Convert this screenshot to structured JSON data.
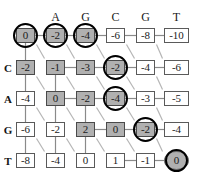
{
  "figure": {
    "type": "dp-matrix"
  },
  "colors": {
    "shaded_cell": "#b0b0b0",
    "plain_cell": "#ffffff",
    "cell_border": "#5a5a5a",
    "highlight_ring": "#000000",
    "edge_diagonal": "#b5b5b5",
    "edge_straight": "#8a8a8a",
    "text": "#1a1a1a"
  },
  "matrix": {
    "column_headers": [
      "",
      "A",
      "G",
      "C",
      "G",
      "T"
    ],
    "row_headers": [
      "",
      "C",
      "A",
      "G",
      "T"
    ],
    "rows": [
      {
        "label": "",
        "cells": [
          {
            "value": "0",
            "shaded": true,
            "circled": true,
            "shape": "box"
          },
          {
            "value": "-2",
            "shaded": true,
            "circled": true,
            "shape": "box"
          },
          {
            "value": "-4",
            "shaded": true,
            "circled": true,
            "shape": "box"
          },
          {
            "value": "-6",
            "shaded": false,
            "circled": false,
            "shape": "box"
          },
          {
            "value": "-8",
            "shaded": false,
            "circled": false,
            "shape": "box"
          },
          {
            "value": "-10",
            "shaded": false,
            "circled": false,
            "shape": "box"
          }
        ]
      },
      {
        "label": "C",
        "cells": [
          {
            "value": "-2",
            "shaded": true,
            "circled": false,
            "shape": "box"
          },
          {
            "value": "-1",
            "shaded": true,
            "circled": false,
            "shape": "box"
          },
          {
            "value": "-3",
            "shaded": true,
            "circled": false,
            "shape": "box"
          },
          {
            "value": "-2",
            "shaded": true,
            "circled": true,
            "shape": "box"
          },
          {
            "value": "-4",
            "shaded": false,
            "circled": false,
            "shape": "box"
          },
          {
            "value": "-6",
            "shaded": false,
            "circled": false,
            "shape": "box"
          }
        ]
      },
      {
        "label": "A",
        "cells": [
          {
            "value": "-4",
            "shaded": false,
            "circled": false,
            "shape": "box"
          },
          {
            "value": "0",
            "shaded": true,
            "circled": false,
            "shape": "box"
          },
          {
            "value": "-2",
            "shaded": true,
            "circled": false,
            "shape": "box"
          },
          {
            "value": "-4",
            "shaded": true,
            "circled": true,
            "shape": "box"
          },
          {
            "value": "-3",
            "shaded": false,
            "circled": false,
            "shape": "box"
          },
          {
            "value": "-5",
            "shaded": false,
            "circled": false,
            "shape": "box"
          }
        ]
      },
      {
        "label": "G",
        "cells": [
          {
            "value": "-6",
            "shaded": false,
            "circled": false,
            "shape": "box"
          },
          {
            "value": "-2",
            "shaded": false,
            "circled": false,
            "shape": "box"
          },
          {
            "value": "2",
            "shaded": true,
            "circled": false,
            "shape": "box"
          },
          {
            "value": "0",
            "shaded": true,
            "circled": false,
            "shape": "box"
          },
          {
            "value": "-2",
            "shaded": true,
            "circled": true,
            "shape": "box"
          },
          {
            "value": "-4",
            "shaded": false,
            "circled": false,
            "shape": "box"
          }
        ]
      },
      {
        "label": "T",
        "cells": [
          {
            "value": "-8",
            "shaded": false,
            "circled": false,
            "shape": "box"
          },
          {
            "value": "-4",
            "shaded": false,
            "circled": false,
            "shape": "box"
          },
          {
            "value": "0",
            "shaded": false,
            "circled": false,
            "shape": "box"
          },
          {
            "value": "1",
            "shaded": false,
            "circled": false,
            "shape": "box"
          },
          {
            "value": "-1",
            "shaded": false,
            "circled": false,
            "shape": "box"
          },
          {
            "value": "0",
            "shaded": true,
            "circled": true,
            "shape": "circle"
          }
        ]
      }
    ]
  },
  "geometry": {
    "col_x": [
      16,
      46,
      76,
      106,
      136
    ],
    "col_x_last": 164,
    "cell_w": 19,
    "cell_w_last": 25,
    "row_y": [
      28,
      60,
      91,
      122,
      153
    ],
    "cell_h": 15,
    "header_y": 10,
    "row_label_x": 2
  },
  "edges": {
    "horizontal": [
      {
        "r": 0,
        "c": 0
      },
      {
        "r": 0,
        "c": 1
      },
      {
        "r": 0,
        "c": 2
      },
      {
        "r": 0,
        "c": 3
      },
      {
        "r": 0,
        "c": 4
      },
      {
        "r": 1,
        "c": 1
      },
      {
        "r": 1,
        "c": 2
      },
      {
        "r": 1,
        "c": 3
      },
      {
        "r": 1,
        "c": 4
      },
      {
        "r": 2,
        "c": 1
      },
      {
        "r": 2,
        "c": 2
      },
      {
        "r": 2,
        "c": 3
      },
      {
        "r": 2,
        "c": 4
      },
      {
        "r": 3,
        "c": 2
      },
      {
        "r": 3,
        "c": 3
      },
      {
        "r": 3,
        "c": 4
      },
      {
        "r": 4,
        "c": 3
      },
      {
        "r": 4,
        "c": 4
      }
    ],
    "vertical": [
      {
        "r": 0,
        "c": 0
      },
      {
        "r": 1,
        "c": 0
      },
      {
        "r": 2,
        "c": 0
      },
      {
        "r": 3,
        "c": 0
      },
      {
        "r": 1,
        "c": 1
      },
      {
        "r": 2,
        "c": 1
      },
      {
        "r": 3,
        "c": 1
      },
      {
        "r": 2,
        "c": 2
      },
      {
        "r": 3,
        "c": 2
      }
    ],
    "diagonal": [
      {
        "r": 0,
        "c": 0
      },
      {
        "r": 0,
        "c": 1
      },
      {
        "r": 0,
        "c": 2
      },
      {
        "r": 0,
        "c": 3
      },
      {
        "r": 0,
        "c": 4
      },
      {
        "r": 1,
        "c": 0
      },
      {
        "r": 1,
        "c": 1
      },
      {
        "r": 1,
        "c": 2
      },
      {
        "r": 1,
        "c": 3
      },
      {
        "r": 1,
        "c": 4
      },
      {
        "r": 2,
        "c": 0
      },
      {
        "r": 2,
        "c": 1
      },
      {
        "r": 2,
        "c": 2
      },
      {
        "r": 2,
        "c": 3
      },
      {
        "r": 2,
        "c": 4
      },
      {
        "r": 3,
        "c": 0
      },
      {
        "r": 3,
        "c": 1
      },
      {
        "r": 3,
        "c": 2
      },
      {
        "r": 3,
        "c": 3
      },
      {
        "r": 3,
        "c": 4
      }
    ]
  }
}
